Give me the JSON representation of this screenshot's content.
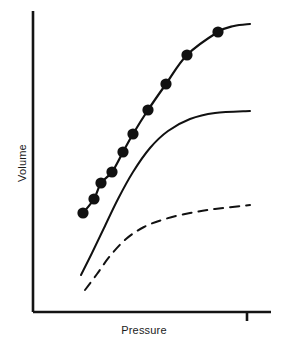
{
  "chart_data": {
    "type": "line",
    "title": "",
    "subtitle": "",
    "xlabel": "Pressure",
    "ylabel": "Volume",
    "grid": false,
    "legend": "none",
    "axes": {
      "x_axis_line": {
        "x_start_px": 33,
        "x_end_px": 271,
        "y_px": 312
      },
      "y_axis_line": {
        "y_start_px": 11,
        "y_end_px": 312,
        "x_px": 33
      },
      "x_ticks_px": [
        247
      ],
      "y_ticks_px": [],
      "x_tick_labels": [],
      "y_tick_labels": [],
      "xlim_px": [
        33,
        271
      ],
      "ylim_px": [
        312,
        11
      ],
      "axis_color": "#141414",
      "axis_width_px": 2.6
    },
    "series": [
      {
        "name": "upper-curve-with-markers",
        "style": "solid",
        "color": "#111111",
        "line_width_px": 2.2,
        "markers": "filled-circle",
        "marker_color": "#111111",
        "marker_radius_px": 5.6,
        "points_px": [
          [
            83,
            213
          ],
          [
            94,
            199
          ],
          [
            101,
            183
          ],
          [
            112,
            172
          ],
          [
            123,
            152
          ],
          [
            133,
            134
          ],
          [
            148,
            110
          ],
          [
            166,
            84
          ],
          [
            187,
            55
          ],
          [
            218,
            32
          ]
        ],
        "marker_points_px": [
          [
            83,
            213
          ],
          [
            94,
            199
          ],
          [
            101,
            183
          ],
          [
            112,
            172
          ],
          [
            123,
            152
          ],
          [
            133,
            134
          ],
          [
            148,
            110
          ],
          [
            166,
            84
          ],
          [
            187,
            55
          ],
          [
            218,
            32
          ]
        ],
        "tail_points_px": [
          [
            218,
            32
          ],
          [
            234,
            26
          ],
          [
            250,
            24
          ]
        ]
      },
      {
        "name": "middle-curve",
        "style": "solid",
        "color": "#111111",
        "line_width_px": 2.0,
        "markers": "none",
        "points_px": [
          [
            81,
            275
          ],
          [
            92,
            253
          ],
          [
            104,
            228
          ],
          [
            118,
            199
          ],
          [
            133,
            172
          ],
          [
            150,
            148
          ],
          [
            168,
            131
          ],
          [
            190,
            119
          ],
          [
            215,
            113
          ],
          [
            250,
            111
          ]
        ]
      },
      {
        "name": "lower-curve-dashed",
        "style": "dashed",
        "color": "#111111",
        "line_width_px": 2.0,
        "dash_pattern_px": [
          9,
          7
        ],
        "markers": "none",
        "points_px": [
          [
            85,
            290
          ],
          [
            97,
            274
          ],
          [
            110,
            256
          ],
          [
            126,
            239
          ],
          [
            144,
            227
          ],
          [
            165,
            219
          ],
          [
            190,
            213
          ],
          [
            215,
            209
          ],
          [
            250,
            205
          ]
        ]
      }
    ],
    "background_color": "#ffffff"
  }
}
